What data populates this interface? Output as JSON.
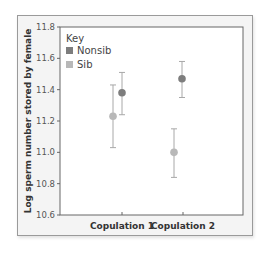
{
  "chart_data": {
    "type": "scatter",
    "title": "",
    "xlabel": "",
    "ylabel": "Log sperm number stored by female",
    "categories": [
      "Copulation 1",
      "Copulation 2"
    ],
    "ylim": [
      10.6,
      11.8
    ],
    "yticks": [
      "11.8",
      "11.6",
      "11.4",
      "11.2",
      "11.0",
      "10.8",
      "10.6"
    ],
    "grid": false,
    "legend": {
      "title": "Key",
      "position": "upper left",
      "entries": [
        "Nonsib",
        "Sib"
      ]
    },
    "series": [
      {
        "name": "Nonsib",
        "color": "#7d7d7d",
        "values": [
          11.38,
          11.47
        ],
        "error_low": [
          11.24,
          11.35
        ],
        "error_high": [
          11.51,
          11.58
        ]
      },
      {
        "name": "Sib",
        "color": "#b8b8b8",
        "values": [
          11.23,
          11.0
        ],
        "error_low": [
          11.03,
          10.84
        ],
        "error_high": [
          11.43,
          11.15
        ]
      }
    ]
  },
  "legend": {
    "title": "Key",
    "items": [
      {
        "label": "Nonsib",
        "color": "#7d7d7d"
      },
      {
        "label": "Sib",
        "color": "#b8b8b8"
      }
    ]
  },
  "axis": {
    "ylabel": "Log sperm number stored by female",
    "xcats": [
      "Copulation 1",
      "Copulation 2"
    ]
  },
  "colors": {
    "error_bar": "#a8a8a8",
    "axis": "#666666"
  }
}
